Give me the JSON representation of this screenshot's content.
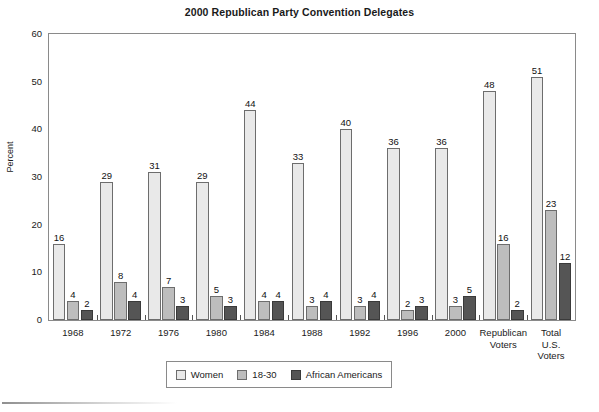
{
  "chart_data": {
    "type": "bar",
    "title": "2000 Republican Party Convention Delegates",
    "xlabel": "",
    "ylabel": "Percent",
    "ylim": [
      0,
      60
    ],
    "yticks": [
      0,
      10,
      20,
      30,
      40,
      50,
      60
    ],
    "grid": false,
    "legend_position": "bottom-center",
    "categories": [
      "1968",
      "1972",
      "1976",
      "1980",
      "1984",
      "1988",
      "1992",
      "1996",
      "2000",
      "Republican Voters",
      "Total U.S. Voters"
    ],
    "category_lines": [
      [
        "1968"
      ],
      [
        "1972"
      ],
      [
        "1976"
      ],
      [
        "1980"
      ],
      [
        "1984"
      ],
      [
        "1988"
      ],
      [
        "1992"
      ],
      [
        "1996"
      ],
      [
        "2000"
      ],
      [
        "Republican",
        "Voters"
      ],
      [
        "Total",
        "U.S.",
        "Voters"
      ]
    ],
    "series": [
      {
        "name": "Women",
        "color": "#e9e9e9",
        "values": [
          16,
          29,
          31,
          29,
          44,
          33,
          40,
          36,
          36,
          48,
          51
        ]
      },
      {
        "name": "18-30",
        "color": "#bdbdbd",
        "values": [
          4,
          8,
          7,
          5,
          4,
          3,
          3,
          2,
          3,
          16,
          23
        ]
      },
      {
        "name": "African Americans",
        "color": "#555555",
        "values": [
          2,
          4,
          3,
          3,
          4,
          4,
          4,
          3,
          5,
          2,
          12
        ]
      }
    ]
  },
  "legend": {
    "items": [
      {
        "label": "Women"
      },
      {
        "label": "18-30"
      },
      {
        "label": "African Americans"
      }
    ]
  }
}
